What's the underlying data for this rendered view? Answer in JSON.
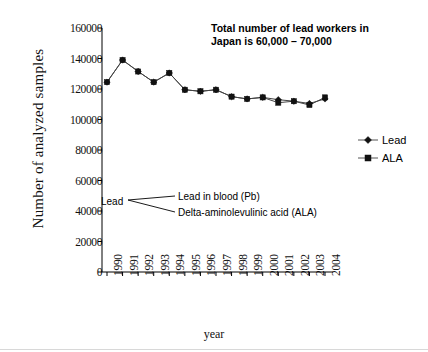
{
  "chart_data": {
    "type": "line",
    "title": "",
    "xlabel": "year",
    "ylabel": "Number of analyzed samples",
    "categories": [
      "1990",
      "1991",
      "1992",
      "1993",
      "1994",
      "1995",
      "1996",
      "1997",
      "1998",
      "1999",
      "2000",
      "2001",
      "2002",
      "2003",
      "2004"
    ],
    "ylim": [
      0,
      160000
    ],
    "ytick_values": [
      0,
      20000,
      40000,
      60000,
      80000,
      100000,
      120000,
      140000,
      160000
    ],
    "ytick_labels": [
      "0",
      "20000",
      "40000",
      "60000",
      "80000",
      "100000",
      "120000",
      "140000",
      "160000"
    ],
    "grid": false,
    "legend_position": "right",
    "series": [
      {
        "name": "Lead",
        "marker": "diamond",
        "values": [
          124500,
          139000,
          131500,
          124500,
          130500,
          119500,
          118500,
          119500,
          115000,
          113500,
          114500,
          113000,
          112000,
          110500,
          113500
        ]
      },
      {
        "name": "ALA",
        "marker": "square",
        "values": [
          124500,
          139000,
          131500,
          124500,
          130500,
          119500,
          118500,
          119500,
          115000,
          113500,
          114500,
          111000,
          112000,
          109500,
          114500
        ]
      }
    ],
    "annotations": {
      "note_line_1": "Total number of lead workers in",
      "note_line_2": "Japan is 60,000 – 70,000",
      "callout_source": "Lead",
      "callout_target_1": "Lead in blood (Pb)",
      "callout_target_2": "Delta-aminolevulinic acid (ALA)"
    }
  },
  "legend": {
    "entries": [
      {
        "label": "Lead",
        "marker": "diamond-marker-icon"
      },
      {
        "label": "ALA",
        "marker": "square-marker-icon"
      }
    ]
  },
  "colors": {
    "axis": "#000000",
    "line": "#444444",
    "marker": "#111111",
    "background": "#ffffff"
  }
}
